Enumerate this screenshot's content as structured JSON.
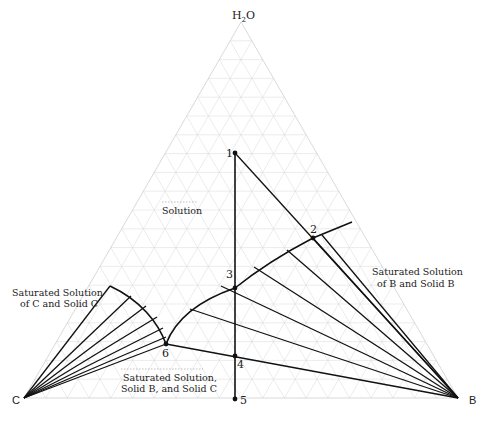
{
  "diagram": {
    "type": "ternary-phase-diagram",
    "vertices": {
      "top": {
        "label_main": "H",
        "label_sub": "2",
        "label_tail": "O"
      },
      "left": {
        "label": "C"
      },
      "right": {
        "label": "B"
      }
    },
    "regions": {
      "solution": "Solution",
      "sat_b_line1": "Saturated Solution",
      "sat_b_line2": "of B and Solid B",
      "sat_c_line1": "Saturated Solution",
      "sat_c_line2": "of C and Solid C",
      "sat_bc_line1": "Saturated Solution,",
      "sat_bc_line2": "Solid B, and Solid C"
    },
    "points": [
      {
        "id": "1",
        "label": "1"
      },
      {
        "id": "2",
        "label": "2"
      },
      {
        "id": "3",
        "label": "3"
      },
      {
        "id": "4",
        "label": "4"
      },
      {
        "id": "5",
        "label": "5"
      },
      {
        "id": "6",
        "label": "6"
      }
    ],
    "colors": {
      "lines": "#111111",
      "grid": "#d8d8d8",
      "background": "#ffffff"
    }
  }
}
